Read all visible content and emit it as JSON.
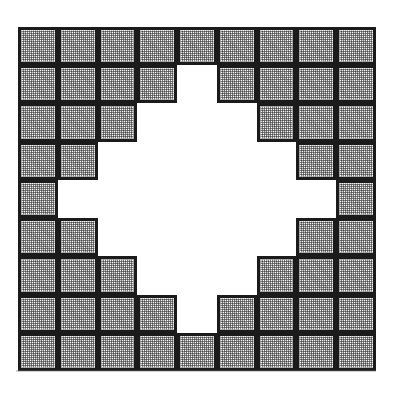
{
  "figure": {
    "type": "tile-grid",
    "rows": 9,
    "columns": 9,
    "tile_fill_label": "stippled grey",
    "tile_empty_label": "white",
    "border_color": "#1b1b1b",
    "tile_color": "#d4d4d4",
    "background_color": "#ffffff",
    "filled_tile_count": 60,
    "empty_tile_count": 21,
    "grid": [
      [
        1,
        1,
        1,
        1,
        1,
        1,
        1,
        1,
        1
      ],
      [
        1,
        1,
        1,
        1,
        0,
        1,
        1,
        1,
        1
      ],
      [
        1,
        1,
        1,
        0,
        0,
        0,
        1,
        1,
        1
      ],
      [
        1,
        1,
        0,
        0,
        0,
        0,
        0,
        1,
        1
      ],
      [
        1,
        0,
        0,
        0,
        0,
        0,
        0,
        0,
        1
      ],
      [
        1,
        1,
        0,
        0,
        0,
        0,
        0,
        1,
        1
      ],
      [
        1,
        1,
        1,
        0,
        0,
        0,
        1,
        1,
        1
      ],
      [
        1,
        1,
        1,
        1,
        0,
        1,
        1,
        1,
        1
      ],
      [
        1,
        1,
        1,
        1,
        1,
        1,
        1,
        1,
        1
      ]
    ]
  }
}
